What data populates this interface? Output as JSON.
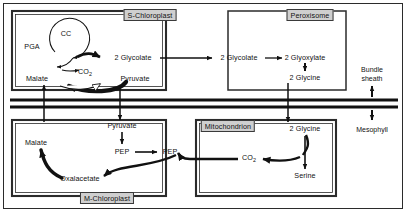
{
  "diagram": {
    "organelles": [
      {
        "id": "s-chloroplast",
        "label": "S-Chloroplast",
        "x": 150,
        "y": 15
      },
      {
        "id": "peroxisome",
        "label": "Peroxisome",
        "x": 310,
        "y": 15
      },
      {
        "id": "mitochondrion",
        "label": "Mitochondrion",
        "x": 228,
        "y": 126
      },
      {
        "id": "m-chloroplast",
        "label": "M-Chloroplast",
        "x": 107,
        "y": 198
      }
    ],
    "metabolites": [
      {
        "id": "cc",
        "label": "CC",
        "x": 66,
        "y": 34
      },
      {
        "id": "pga",
        "label": "PGA",
        "x": 32,
        "y": 47
      },
      {
        "id": "malate-bs",
        "label": "Malate",
        "x": 37,
        "y": 79
      },
      {
        "id": "co2-bs",
        "label": "CO2",
        "x": 85,
        "y": 73
      },
      {
        "id": "pyruvate-bs",
        "label": "Pyruvate",
        "x": 135,
        "y": 79
      },
      {
        "id": "glycolate-s",
        "label": "2 Glycolate",
        "x": 133,
        "y": 58
      },
      {
        "id": "glycolate-p",
        "label": "2 Glycolate",
        "x": 239,
        "y": 58
      },
      {
        "id": "glyoxylate",
        "label": "2 Glyoxylate",
        "x": 305,
        "y": 58
      },
      {
        "id": "glycine-p",
        "label": "2 Glycine",
        "x": 305,
        "y": 78
      },
      {
        "id": "glycine-m",
        "label": "2 Glycine",
        "x": 305,
        "y": 129
      },
      {
        "id": "serine",
        "label": "Serine",
        "x": 305,
        "y": 176
      },
      {
        "id": "co2-mito",
        "label": "CO2",
        "x": 249,
        "y": 159
      },
      {
        "id": "pyruvate-m",
        "label": "Pyruvate",
        "x": 122,
        "y": 126
      },
      {
        "id": "pep-left",
        "label": "PEP",
        "x": 122,
        "y": 152
      },
      {
        "id": "pep-right",
        "label": "PEP",
        "x": 170,
        "y": 152
      },
      {
        "id": "malate-m",
        "label": "Malate",
        "x": 36,
        "y": 143
      },
      {
        "id": "oxalacetate",
        "label": "Oxalacetate",
        "x": 80,
        "y": 179
      }
    ],
    "tissues": [
      {
        "id": "bundle-sheath",
        "line1": "Bundle",
        "line2": "sheath",
        "x": 372,
        "y": 74
      },
      {
        "id": "mesophyll",
        "line1": "Mesophyll",
        "line2": "",
        "x": 372,
        "y": 130
      }
    ],
    "colors": {
      "ink": "#111111",
      "frame": "#2b2b2b",
      "organelle_fill": "#cfcfcf",
      "background": "#ffffff"
    }
  }
}
